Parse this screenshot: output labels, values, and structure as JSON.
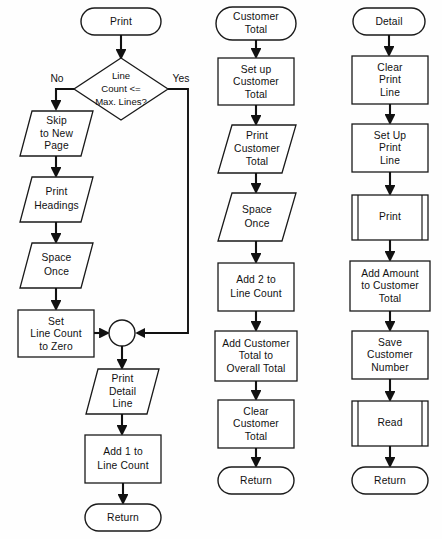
{
  "diagram": {
    "type": "flowchart",
    "background_color": "#fefefe",
    "line_color": "#111111",
    "shape_fill": "#ffffff"
  },
  "columns": [
    {
      "name": "print-routine",
      "nodes": [
        {
          "id": "c1n1",
          "shape": "terminal",
          "label": "Print"
        },
        {
          "id": "c1n2",
          "shape": "decision",
          "label_lines": [
            "Line",
            "Count <=",
            "Max. Lines?"
          ]
        },
        {
          "id": "c1n3",
          "shape": "io",
          "label_lines": [
            "Skip",
            "to New",
            "Page"
          ]
        },
        {
          "id": "c1n4",
          "shape": "io",
          "label_lines": [
            "Print",
            "Headings"
          ]
        },
        {
          "id": "c1n5",
          "shape": "io",
          "label_lines": [
            "Space",
            "Once"
          ]
        },
        {
          "id": "c1n6",
          "shape": "process",
          "label_lines": [
            "Set",
            "Line Count",
            "to Zero"
          ]
        },
        {
          "id": "c1n7",
          "shape": "connector",
          "label": ""
        },
        {
          "id": "c1n8",
          "shape": "io",
          "label_lines": [
            "Print",
            "Detail",
            "Line"
          ]
        },
        {
          "id": "c1n9",
          "shape": "process",
          "label_lines": [
            "Add 1 to",
            "Line Count"
          ]
        },
        {
          "id": "c1n10",
          "shape": "terminal",
          "label": "Return"
        }
      ],
      "branch_labels": {
        "no": "No",
        "yes": "Yes"
      }
    },
    {
      "name": "customer-total-routine",
      "nodes": [
        {
          "id": "c2n1",
          "shape": "terminal",
          "label_lines": [
            "Customer",
            "Total"
          ]
        },
        {
          "id": "c2n2",
          "shape": "process",
          "label_lines": [
            "Set up",
            "Customer",
            "Total"
          ]
        },
        {
          "id": "c2n3",
          "shape": "io",
          "label_lines": [
            "Print",
            "Customer",
            "Total"
          ]
        },
        {
          "id": "c2n4",
          "shape": "io",
          "label_lines": [
            "Space",
            "Once"
          ]
        },
        {
          "id": "c2n5",
          "shape": "process",
          "label_lines": [
            "Add 2 to",
            "Line Count"
          ]
        },
        {
          "id": "c2n6",
          "shape": "process",
          "label_lines": [
            "Add Customer",
            "Total to",
            "Overall Total"
          ]
        },
        {
          "id": "c2n7",
          "shape": "process",
          "label_lines": [
            "Clear",
            "Customer",
            "Total"
          ]
        },
        {
          "id": "c2n8",
          "shape": "terminal",
          "label": "Return"
        }
      ]
    },
    {
      "name": "detail-routine",
      "nodes": [
        {
          "id": "c3n1",
          "shape": "terminal",
          "label": "Detail"
        },
        {
          "id": "c3n2",
          "shape": "process",
          "label_lines": [
            "Clear",
            "Print",
            "Line"
          ]
        },
        {
          "id": "c3n3",
          "shape": "process",
          "label_lines": [
            "Set Up",
            "Print",
            "Line"
          ]
        },
        {
          "id": "c3n4",
          "shape": "predefined",
          "label": "Print"
        },
        {
          "id": "c3n5",
          "shape": "process",
          "label_lines": [
            "Add Amount",
            "to Customer",
            "Total"
          ]
        },
        {
          "id": "c3n6",
          "shape": "process",
          "label_lines": [
            "Save",
            "Customer",
            "Number"
          ]
        },
        {
          "id": "c3n7",
          "shape": "predefined",
          "label": "Read"
        },
        {
          "id": "c3n8",
          "shape": "terminal",
          "label": "Return"
        }
      ]
    }
  ],
  "labels": {
    "print": "Print",
    "line": "Line",
    "count_le": "Count <=",
    "max_lines": "Max. Lines?",
    "no": "No",
    "yes": "Yes",
    "skip": "Skip",
    "to_new": "to New",
    "page": "Page",
    "print_headings_1": "Print",
    "print_headings_2": "Headings",
    "space": "Space",
    "once": "Once",
    "set": "Set",
    "line_count": "Line Count",
    "to_zero": "to Zero",
    "print_detail_1": "Print",
    "print_detail_2": "Detail",
    "print_detail_3": "Line",
    "add1to": "Add 1 to",
    "line_count2": "Line Count",
    "return1": "Return",
    "customer": "Customer",
    "total": "Total",
    "setup": "Set up",
    "customer2": "Customer",
    "total2": "Total",
    "print_cust_1": "Print",
    "print_cust_2": "Customer",
    "print_cust_3": "Total",
    "space2": "Space",
    "once2": "Once",
    "add2to": "Add 2 to",
    "line_count3": "Line Count",
    "add_cust": "Add Customer",
    "total_to": "Total to",
    "overall_total": "Overall Total",
    "clear": "Clear",
    "customer3": "Customer",
    "total3": "Total",
    "return2": "Return",
    "detail": "Detail",
    "clear2": "Clear",
    "print2": "Print",
    "line2": "Line",
    "setup2": "Set Up",
    "print3": "Print",
    "line3": "Line",
    "print_sub": "Print",
    "add_amount": "Add Amount",
    "to_customer": "to Customer",
    "total4": "Total",
    "save": "Save",
    "customer4": "Customer",
    "number": "Number",
    "read_sub": "Read",
    "return3": "Return"
  }
}
